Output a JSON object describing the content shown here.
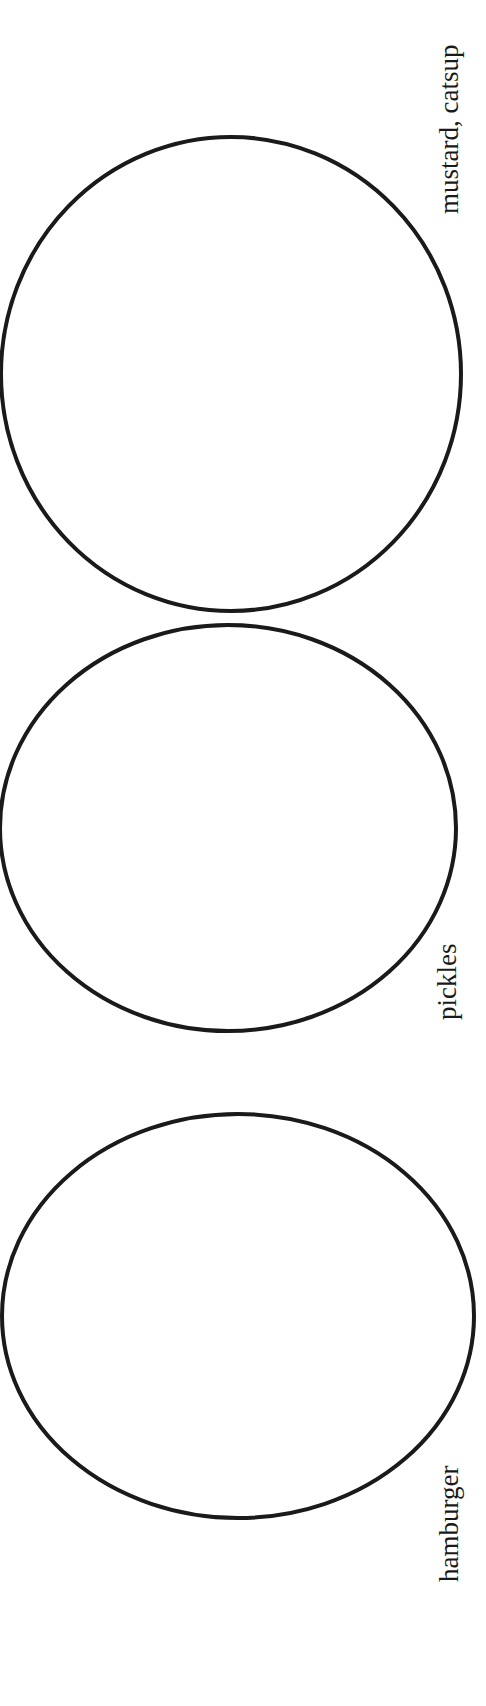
{
  "document": {
    "type": "worksheet",
    "description": "Three stacked outlined circles, each with a rotated text label"
  },
  "colors": {
    "background": "#ffffff",
    "stroke": "#1a1a1a",
    "text": "#1a1a1a"
  },
  "circles": [
    {
      "id": "top",
      "label": "mustard, catsup",
      "cx": 231,
      "cy": 362,
      "rx": 231,
      "ry": 238
    },
    {
      "id": "middle",
      "label": "pickles",
      "cx": 228,
      "cy": 827,
      "rx": 228,
      "ry": 202
    },
    {
      "id": "bottom",
      "label": "hamburger",
      "cx": 237,
      "cy": 1316,
      "rx": 237,
      "ry": 201
    }
  ]
}
